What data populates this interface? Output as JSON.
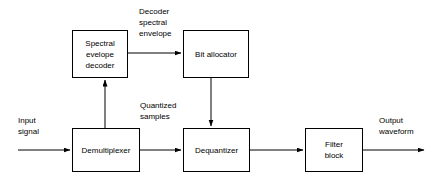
{
  "diagram": {
    "background_color": "#ffffff",
    "line_color": "#000000",
    "text_color": "#000000",
    "nodes": [
      {
        "id": "spectral-envelope-decoder",
        "label": "Spectral\nevelope\ndecoder"
      },
      {
        "id": "bit-allocator",
        "label": "Bit allocator"
      },
      {
        "id": "demultiplexer",
        "label": "Demultiplexer"
      },
      {
        "id": "dequantizer",
        "label": "Dequantizer"
      },
      {
        "id": "filter-block",
        "label": "Filter\nblock"
      }
    ],
    "edge_labels": [
      {
        "id": "decoder-spectral-envelope",
        "text": "Decoder\nspectral\nenvelope"
      },
      {
        "id": "quantized-samples",
        "text": "Quantized\nsamples"
      },
      {
        "id": "input-signal",
        "text": "Input\nsignal"
      },
      {
        "id": "output-waveform",
        "text": "Output\nwaveform"
      }
    ],
    "edges": [
      {
        "id": "input-to-demultiplexer",
        "from": "input",
        "to": "demultiplexer",
        "direction": "right"
      },
      {
        "id": "demultiplexer-to-decoder",
        "from": "demultiplexer",
        "to": "spectral-envelope-decoder",
        "direction": "up"
      },
      {
        "id": "decoder-to-bit-allocator",
        "from": "spectral-envelope-decoder",
        "to": "bit-allocator",
        "direction": "right"
      },
      {
        "id": "bit-allocator-to-dequantizer",
        "from": "bit-allocator",
        "to": "dequantizer",
        "direction": "down"
      },
      {
        "id": "demultiplexer-to-dequantizer",
        "from": "demultiplexer",
        "to": "dequantizer",
        "direction": "right"
      },
      {
        "id": "dequantizer-to-filter-block",
        "from": "dequantizer",
        "to": "filter-block",
        "direction": "right"
      },
      {
        "id": "filter-block-to-output",
        "from": "filter-block",
        "to": "output",
        "direction": "right"
      }
    ]
  }
}
